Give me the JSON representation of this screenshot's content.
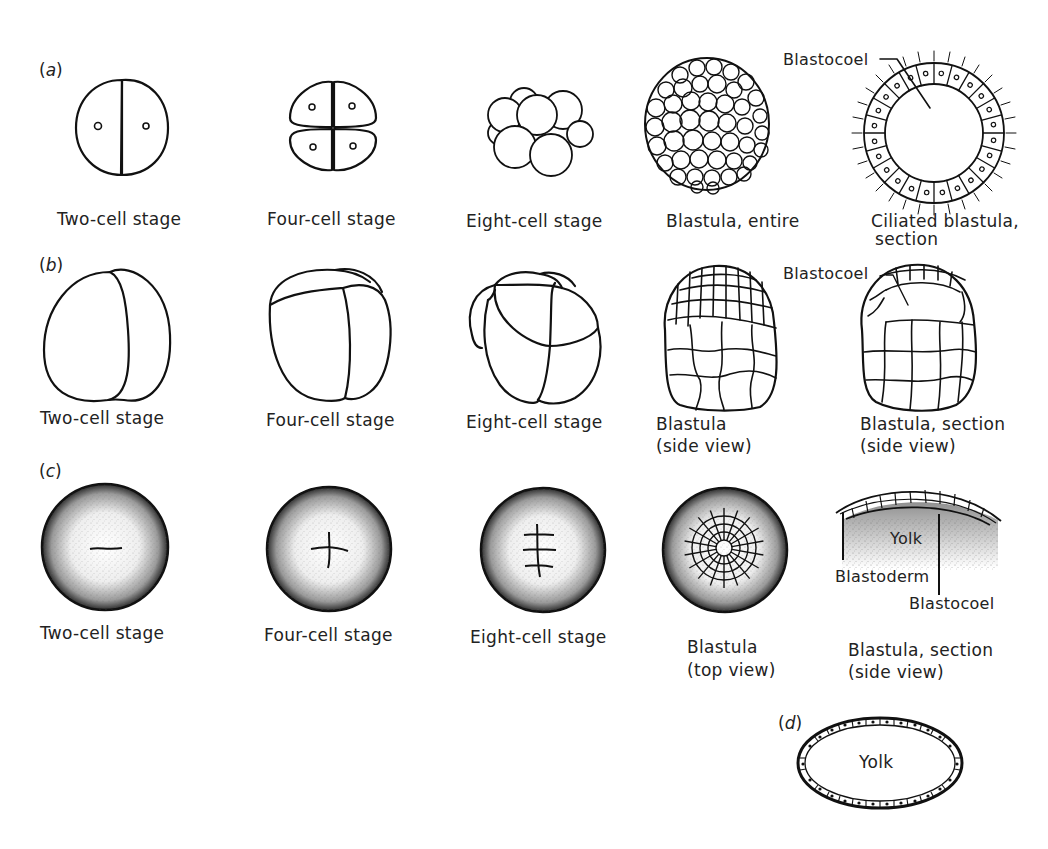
{
  "figure": {
    "rows": [
      {
        "id": "a",
        "label": "a",
        "stages": [
          {
            "caption": "Two-cell stage"
          },
          {
            "caption": "Four-cell stage"
          },
          {
            "caption": "Eight-cell stage"
          },
          {
            "caption": "Blastula, entire"
          },
          {
            "caption_line1": "Ciliated blastula,",
            "caption_line2": "section",
            "annotation": "Blastocoel"
          }
        ]
      },
      {
        "id": "b",
        "label": "b",
        "stages": [
          {
            "caption": "Two-cell stage"
          },
          {
            "caption": "Four-cell stage"
          },
          {
            "caption": "Eight-cell stage"
          },
          {
            "caption_line1": "Blastula",
            "caption_line2": "(side view)"
          },
          {
            "caption_line1": "Blastula, section",
            "caption_line2": "(side view)",
            "annotation": "Blastocoel"
          }
        ]
      },
      {
        "id": "c",
        "label": "c",
        "stages": [
          {
            "caption": "Two-cell stage"
          },
          {
            "caption": "Four-cell stage"
          },
          {
            "caption": "Eight-cell stage"
          },
          {
            "caption_line1": "Blastula",
            "caption_line2": "(top view)"
          },
          {
            "caption_line1": "Blastula, section",
            "caption_line2": "(side view)",
            "annotations": [
              "Yolk",
              "Blastoderm",
              "Blastocoel"
            ]
          }
        ]
      },
      {
        "id": "d",
        "label": "d",
        "stages": [
          {
            "annotation": "Yolk"
          }
        ]
      }
    ]
  },
  "colors": {
    "ink": "#111111",
    "background": "#ffffff"
  }
}
